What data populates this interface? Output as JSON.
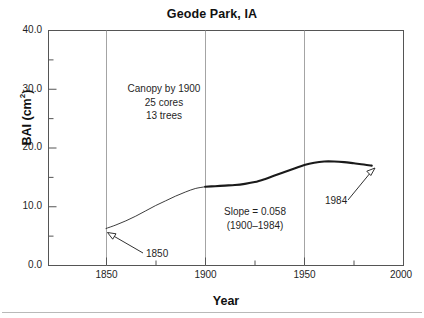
{
  "figure": {
    "title": "Geode Park, IA",
    "axis_x_label": "Year",
    "axis_y_label_main": "BAI (cm",
    "axis_y_label_sup": "2",
    "axis_y_label_close": ")",
    "background_color": "#ffffff",
    "line_color": "#1a1a1a",
    "grid_color": "#9a9a9a",
    "frame_color": "#555555"
  },
  "annotations": {
    "stand_info": {
      "line1": "Canopy by 1900",
      "line2": "25 cores",
      "line3": "13 trees"
    },
    "slope_info": {
      "line1": "Slope = 0.058",
      "line2": "(1900–1984)"
    },
    "start_marker_label": "1850",
    "end_marker_label": "1984"
  },
  "ticks": {
    "y_labels": [
      "40.0",
      "30.0",
      "20.0",
      "10.0",
      "0.0"
    ],
    "x_labels": [
      "1850",
      "1900",
      "1950",
      "2000"
    ]
  },
  "chart_data": {
    "type": "line",
    "title": "Geode Park, IA",
    "xlabel": "Year",
    "ylabel": "BAI (cm2)",
    "xlim": [
      1821,
      2000
    ],
    "ylim": [
      0.0,
      40.0
    ],
    "grid": "vertical-only",
    "legend": "none",
    "y_major_ticks": [
      0.0,
      10.0,
      20.0,
      30.0,
      40.0
    ],
    "y_minor_ticks": [
      5.0,
      15.0,
      25.0,
      35.0
    ],
    "x_major_ticks": [
      1850,
      1900,
      1950,
      2000
    ],
    "x_minor_ticks": [
      1875,
      1925,
      1975
    ],
    "series": [
      {
        "name": "BAI pre-canopy (thin line, 1850–1900)",
        "style": "thin",
        "x": [
          1850,
          1855,
          1860,
          1865,
          1870,
          1875,
          1880,
          1885,
          1890,
          1895,
          1900
        ],
        "y": [
          6.3,
          6.9,
          7.6,
          8.4,
          9.3,
          10.2,
          11.0,
          11.8,
          12.5,
          13.1,
          13.4
        ]
      },
      {
        "name": "BAI post-canopy (thick line, 1900–1984)",
        "style": "thick",
        "x": [
          1900,
          1905,
          1910,
          1915,
          1920,
          1925,
          1930,
          1935,
          1940,
          1945,
          1950,
          1955,
          1960,
          1965,
          1970,
          1975,
          1980,
          1984
        ],
        "y": [
          13.4,
          13.5,
          13.6,
          13.7,
          13.9,
          14.2,
          14.7,
          15.3,
          15.9,
          16.5,
          17.1,
          17.5,
          17.7,
          17.7,
          17.6,
          17.4,
          17.2,
          17.0
        ]
      }
    ],
    "annotations": [
      {
        "text": "Canopy by 1900",
        "x": 1874,
        "y": 30.0
      },
      {
        "text": "25 cores",
        "x": 1874,
        "y": 27.6
      },
      {
        "text": "13 trees",
        "x": 1874,
        "y": 25.2
      },
      {
        "text": "Slope = 0.058",
        "x": 1926,
        "y": 10.5
      },
      {
        "text": "(1900–1984)",
        "x": 1926,
        "y": 8.1
      },
      {
        "text": "1850",
        "x": 1866,
        "y": 2.8,
        "arrow_to": [
          1850,
          6.3
        ]
      },
      {
        "text": "1984",
        "x": 1967,
        "y": 11.5,
        "arrow_to": [
          1984,
          17.0
        ]
      }
    ]
  }
}
